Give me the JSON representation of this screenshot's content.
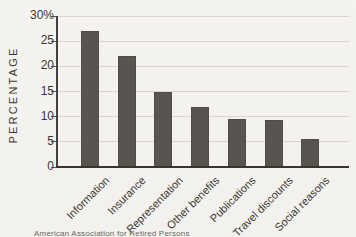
{
  "chart_data": {
    "type": "bar",
    "ylabel": "PERCENTAGE",
    "categories": [
      "Information",
      "Insurance",
      "Representation",
      "Other benefits",
      "Publications",
      "Travel discounts",
      "Social reasons"
    ],
    "values": [
      27,
      22,
      15,
      12,
      9.5,
      9.3,
      5.5
    ],
    "ylim": [
      0,
      30
    ],
    "y_ticks": [
      "30%",
      "25",
      "20",
      "15",
      "10",
      "5",
      "0"
    ],
    "y_tick_values": [
      30,
      25,
      20,
      15,
      10,
      5,
      0
    ],
    "grid": true,
    "legend": "none",
    "bar_color": "#585550",
    "source_caption": "American Association for Retired Persons"
  },
  "colors": {
    "background": "#f3f2ee",
    "bar": "#585550",
    "gridline": "#d8d6cf",
    "axis": "#38352f",
    "text": "#3b3831"
  }
}
